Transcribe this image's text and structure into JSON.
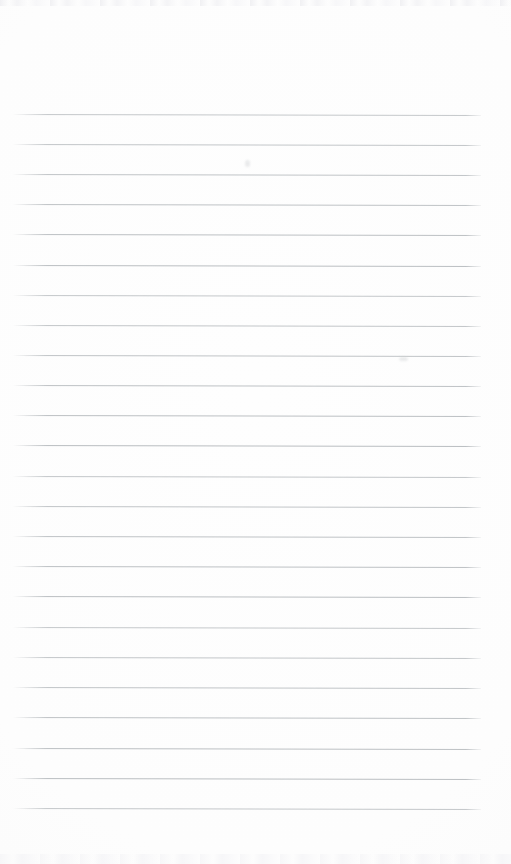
{
  "document": {
    "type": "scanned-lined-paper",
    "title": "Blank ruled notebook page",
    "page_width": 511,
    "page_height": 864,
    "background_color": "#fdfdfd",
    "text_content": "",
    "handwriting_present": false,
    "printed_text_present": false
  },
  "ruling": {
    "line_color": "#b9bdc0",
    "line_thickness_px": 1,
    "line_count": 24,
    "first_line_y": 114,
    "last_line_y": 808,
    "line_spacing_px": 30.2,
    "line_start_x": 13,
    "line_end_x": 481,
    "skew_degrees": 0.12,
    "line_y_positions": [
      114,
      144,
      174,
      204,
      234,
      265,
      295,
      325,
      355,
      385,
      415,
      445,
      476,
      506,
      536,
      566,
      596,
      627,
      657,
      687,
      717,
      748,
      778,
      808
    ]
  },
  "margins": {
    "top_blank_px": 114,
    "bottom_blank_px": 56,
    "left_px": 13,
    "right_px": 30
  },
  "artifacts": {
    "scanner_noise": true,
    "smudges": [
      {
        "x": 245,
        "y": 160,
        "w": 5,
        "h": 7
      },
      {
        "x": 399,
        "y": 357,
        "w": 9,
        "h": 4
      }
    ]
  }
}
